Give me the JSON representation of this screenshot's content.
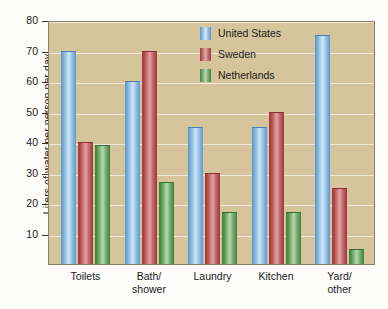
{
  "chart_data": {
    "type": "bar",
    "title": "",
    "subtitle": "",
    "xlabel": "",
    "ylabel": "Liters of water per person per day",
    "categories": [
      "Toilets",
      "Bath/\nshower",
      "Laundry",
      "Kitchen",
      "Yard/\nother"
    ],
    "series": [
      {
        "name": "United States",
        "color": "#7cb3de",
        "values": [
          70,
          60,
          45,
          45,
          75
        ]
      },
      {
        "name": "Sweden",
        "color": "#bf5456",
        "values": [
          40,
          70,
          30,
          50,
          25
        ]
      },
      {
        "name": "Netherlands",
        "color": "#6aa663",
        "values": [
          39,
          27,
          17,
          17,
          5
        ]
      }
    ],
    "ylim": [
      0,
      80
    ],
    "yticks": [
      10,
      20,
      30,
      40,
      50,
      60,
      70,
      80
    ],
    "ytick_labels": [
      "10",
      "20",
      "30",
      "40",
      "50",
      "60",
      "70",
      "80"
    ],
    "grid": true,
    "grid_color": "#f2ecdc",
    "legend_position": "top-center",
    "plot_background": "#d5c49c",
    "figure_background": "#fdfdfb",
    "axis_color": "#8c7f63"
  },
  "legend": {
    "items": [
      {
        "label": "United States",
        "key": "us"
      },
      {
        "label": "Sweden",
        "key": "se"
      },
      {
        "label": "Netherlands",
        "key": "nl"
      }
    ]
  }
}
